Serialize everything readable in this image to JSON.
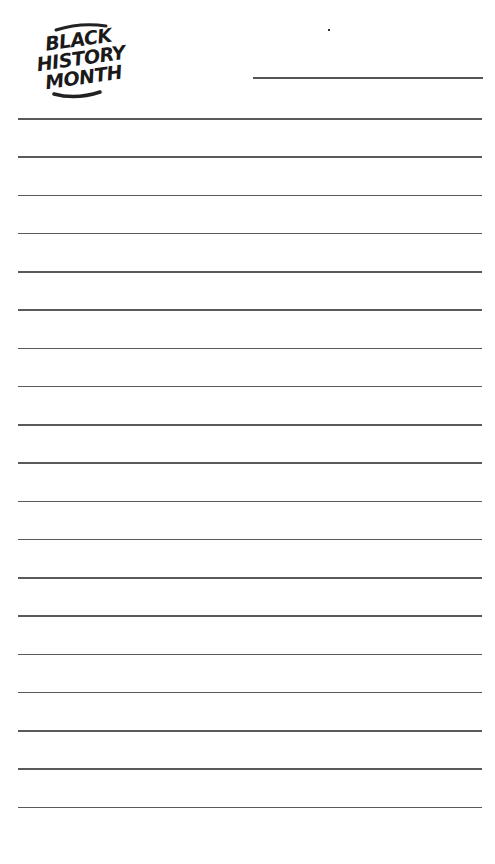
{
  "logo": {
    "lines": [
      "BLACK",
      "HISTORY",
      "MONTH"
    ]
  },
  "page": {
    "type": "lined-notepad",
    "header_line": {
      "name_field": ""
    },
    "rule_count": 19,
    "rule_top": 118,
    "rule_spacing": 38.25,
    "rule_color": "#5a5a5a"
  }
}
